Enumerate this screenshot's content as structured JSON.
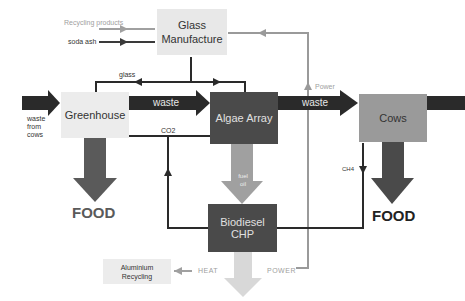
{
  "nodes": {
    "glass_manufacture": {
      "label_line1": "Glass",
      "label_line2": "Manufacture",
      "color": "#e8e8e8"
    },
    "greenhouse": {
      "label": "Greenhouse",
      "color": "#ececec"
    },
    "algae_array": {
      "label": "Algae Array",
      "color": "#4a4a4a"
    },
    "cows": {
      "label": "Cows",
      "color": "#9a9a9a"
    },
    "biodiesel_chp": {
      "label": "Biodiesel CHP",
      "color": "#4a4a4a"
    },
    "aluminium_recycling": {
      "label_line1": "Aluminium",
      "label_line2": "Recycling",
      "color": "#ececec"
    }
  },
  "flows": {
    "recycling_products": "Recycling products",
    "soda_ash": "soda ash",
    "glass": "glass",
    "waste_from_cows_line1": "waste",
    "waste_from_cows_line2": "from",
    "waste_from_cows_line3": "cows",
    "waste_1": "waste",
    "waste_2": "waste",
    "co2": "CO2",
    "fuel_oil_line1": "fuel",
    "fuel_oil_line2": "oil",
    "ch4": "CH4",
    "power_up": "Power",
    "heat": "HEAT",
    "power": "POWER"
  },
  "outputs": {
    "food_left": "FOOD",
    "food_right": "FOOD"
  },
  "colors": {
    "dark": "#2a2a2a",
    "mid": "#5a5a5a",
    "light_arrow": "#a0a0a0",
    "pale_arrow": "#d8d8d8",
    "gray_line": "#9a9a9a"
  }
}
